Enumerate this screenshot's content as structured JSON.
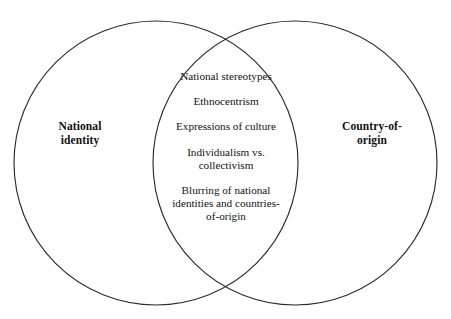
{
  "figure": {
    "type": "venn-diagram",
    "background_color": "#ffffff",
    "stroke_color": "#2b2b2b",
    "text_color": "#121212"
  },
  "sets": {
    "left": {
      "label": "National\nidentity",
      "center_x": 156,
      "center_y": 163,
      "radius": 142
    },
    "right": {
      "label": "Country-of-\norigin",
      "center_x": 295,
      "center_y": 163,
      "radius": 142
    }
  },
  "intersection": {
    "items": [
      {
        "text": "National stereotypes"
      },
      {
        "text": "Ethnocentrism"
      },
      {
        "text": "Expressions of culture"
      },
      {
        "text": "Individualism vs.\ncollectivism"
      },
      {
        "text": "Blurring of national\nidentities and countries-\nof-origin"
      }
    ]
  }
}
